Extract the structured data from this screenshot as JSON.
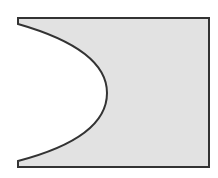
{
  "diagram": {
    "shape": {
      "fill": "#e2e2e2",
      "stroke": "#333333",
      "stroke_width": 2,
      "top_y": 18,
      "bottom_y": 167,
      "left_x": 18,
      "right_x": 209,
      "left_stub_top_end_y": 24,
      "left_stub_bottom_start_y": 161,
      "curve_apex": {
        "x": 107,
        "y": 93
      }
    }
  }
}
